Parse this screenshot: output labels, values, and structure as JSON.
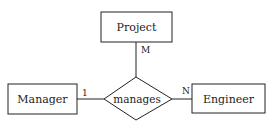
{
  "diagram": {
    "type": "entity-relationship",
    "entities": [
      {
        "id": "project",
        "label": "Project"
      },
      {
        "id": "manager",
        "label": "Manager"
      },
      {
        "id": "engineer",
        "label": "Engineer"
      }
    ],
    "relationship": {
      "label": "manages"
    },
    "cardinalities": {
      "manager": "1",
      "project": "M",
      "engineer": "N"
    },
    "colors": {
      "stroke": "#222222",
      "background": "#ffffff"
    }
  }
}
